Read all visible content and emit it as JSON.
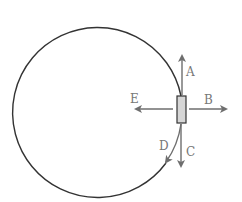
{
  "diagram": {
    "labels": {
      "A": "A",
      "B": "B",
      "C": "C",
      "D": "D",
      "E": "E"
    },
    "colors": {
      "circle": "#333333",
      "arrows": "#6e6e6e",
      "block_fill": "#d6d6d6",
      "block_stroke": "#333333",
      "labels": "#777777"
    }
  }
}
